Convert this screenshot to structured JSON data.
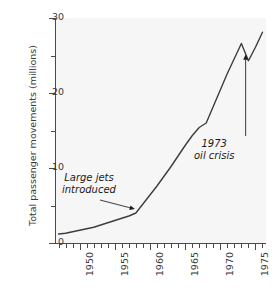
{
  "chart_data": {
    "type": "line",
    "title": "",
    "xlabel": "",
    "ylabel": "Total passenger movements (millions)",
    "xlim": [
      1946.5,
      1976.5
    ],
    "ylim": [
      0,
      30
    ],
    "grid": false,
    "legend": "none",
    "y_ticks": [
      0,
      10,
      20,
      30
    ],
    "y_tick_labels": [
      "0",
      "10",
      "20",
      "30"
    ],
    "y_minor_ticks": [
      5,
      15,
      25
    ],
    "x_ticks": [
      1950,
      1955,
      1960,
      1965,
      1970,
      1975
    ],
    "x_tick_labels": [
      "1950",
      "1955",
      "1960",
      "1965",
      "1970",
      "1975"
    ],
    "x_minor_ticks": [
      1947,
      1948,
      1949,
      1951,
      1952,
      1953,
      1954,
      1956,
      1957,
      1958,
      1959,
      1961,
      1962,
      1963,
      1964,
      1966,
      1967,
      1968,
      1969,
      1971,
      1972,
      1973,
      1974,
      1976
    ],
    "series": [
      {
        "name": "Total passenger movements",
        "color": "#3d3d3d",
        "x": [
          1947,
          1948,
          1949,
          1950,
          1951,
          1952,
          1953,
          1954,
          1955,
          1956,
          1957,
          1958,
          1959,
          1960,
          1961,
          1962,
          1963,
          1964,
          1965,
          1966,
          1967,
          1968,
          1969,
          1970,
          1971,
          1972,
          1973,
          1974,
          1975,
          1976
        ],
        "values": [
          1.2,
          1.3,
          1.5,
          1.7,
          1.9,
          2.1,
          2.4,
          2.7,
          3.0,
          3.3,
          3.6,
          4.0,
          5.2,
          6.4,
          7.6,
          8.9,
          10.2,
          11.6,
          13.0,
          14.3,
          15.4,
          16.0,
          18.2,
          20.4,
          22.6,
          24.6,
          26.6,
          24.3,
          26.1,
          28.1
        ]
      }
    ],
    "annotations": [
      {
        "id": "large-jets",
        "text_line1": "Large jets",
        "text_line2": "introduced",
        "points_to_x": 1958,
        "points_to_y": 4.0
      },
      {
        "id": "oil-crisis",
        "text_line1": "1973",
        "text_line2": "oil crisis",
        "points_to_x": 1973.6,
        "points_to_y": 25.0
      }
    ]
  },
  "style": {
    "panel_background": "#f6f6f6",
    "figure_background": "#ffffff",
    "axis_color": "#4a4a4a",
    "text_color": "#3a3a3a",
    "line_color": "#3d3d3d"
  }
}
